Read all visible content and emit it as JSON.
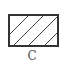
{
  "figure": {
    "shape": "rectangle",
    "fill_pattern": "diagonal-hatch",
    "hatch_line_count": 4,
    "stroke_color": "#333333",
    "caption": "C"
  }
}
